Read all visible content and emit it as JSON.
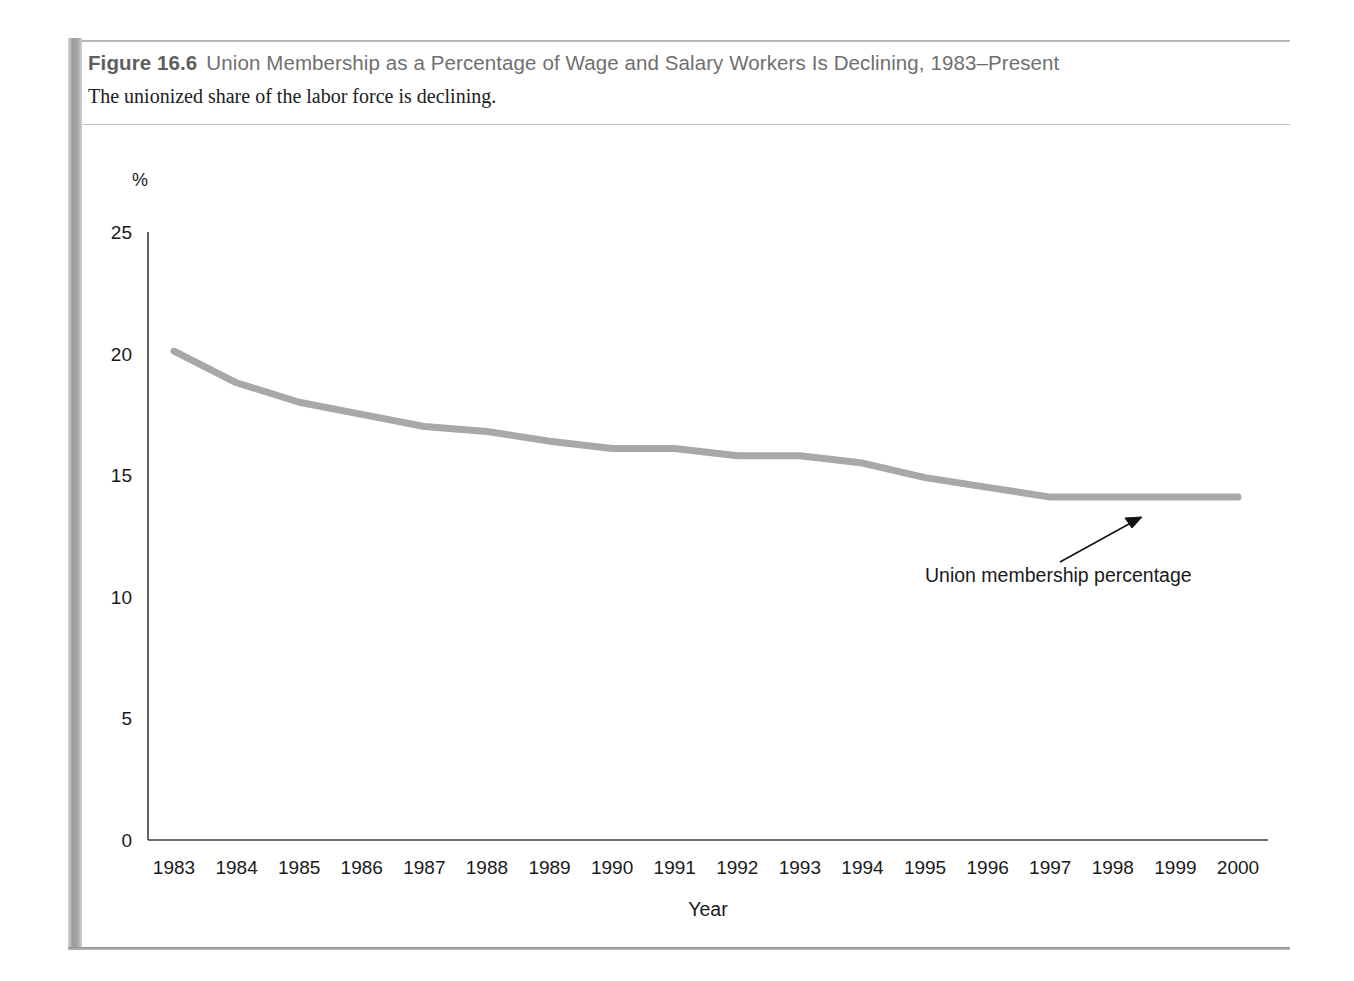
{
  "figure": {
    "number_label": "Figure 16.6",
    "title": "Union Membership as a Percentage of Wage and Salary Workers Is Declining, 1983–Present",
    "subtitle": "The unionized share of the labor force is declining."
  },
  "colors": {
    "series_line": "#a8a8a8",
    "axis": "#3c3c3c",
    "title_text": "#6f6f6f",
    "subtitle_text": "#202020",
    "rule": "#9b9b9b"
  },
  "chart_data": {
    "type": "line",
    "title": "Union Membership as a Percentage of Wage and Salary Workers Is Declining, 1983–Present",
    "subtitle": "The unionized share of the labor force is declining.",
    "xlabel": "Year",
    "ylabel": "%",
    "y_unit_label": "%",
    "categories": [
      "1983",
      "1984",
      "1985",
      "1986",
      "1987",
      "1988",
      "1989",
      "1990",
      "1991",
      "1992",
      "1993",
      "1994",
      "1995",
      "1996",
      "1997",
      "1998",
      "1999",
      "2000"
    ],
    "x": [
      1983,
      1984,
      1985,
      1986,
      1987,
      1988,
      1989,
      1990,
      1991,
      1992,
      1993,
      1994,
      1995,
      1996,
      1997,
      1998,
      1999,
      2000
    ],
    "series": [
      {
        "name": "Union membership percentage",
        "values": [
          20.1,
          18.8,
          18.0,
          17.5,
          17.0,
          16.8,
          16.4,
          16.1,
          16.1,
          15.8,
          15.8,
          15.5,
          14.9,
          14.5,
          14.1,
          14.1,
          14.1,
          14.1
        ]
      }
    ],
    "yticks": [
      0,
      5,
      10,
      15,
      20,
      25
    ],
    "ytick_labels": [
      "0",
      "5",
      "10",
      "15",
      "20",
      "25"
    ],
    "ylim": [
      0,
      25
    ],
    "xlim": [
      1983,
      2000
    ],
    "grid": false,
    "legend": "none",
    "annotations": [
      {
        "text": "Union membership percentage",
        "points_to_year": 1998,
        "points_to_value": 14.1
      }
    ]
  }
}
